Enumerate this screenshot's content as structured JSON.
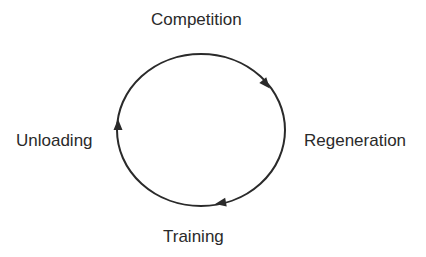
{
  "diagram": {
    "type": "cycle",
    "direction": "clockwise",
    "nodes": [
      {
        "id": "top",
        "label": "Competition"
      },
      {
        "id": "right",
        "label": "Regeneration"
      },
      {
        "id": "bottom",
        "label": "Training"
      },
      {
        "id": "left",
        "label": "Unloading"
      }
    ],
    "edges": [
      {
        "from": "Competition",
        "to": "Regeneration"
      },
      {
        "from": "Regeneration",
        "to": "Training"
      },
      {
        "from": "Training",
        "to": "Unloading"
      },
      {
        "from": "Unloading",
        "to": "Competition"
      }
    ],
    "colors": {
      "stroke": "#2a2a2a",
      "text": "#2a2a2a",
      "background": "#ffffff"
    }
  }
}
